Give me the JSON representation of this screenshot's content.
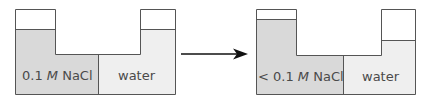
{
  "colors": {
    "salt_solution": "#d9d9d9",
    "water": "#efefef",
    "outline": "#555555",
    "arrow": "#111111",
    "background": "#ffffff"
  },
  "before": {
    "left_label_prefix": "0.1 ",
    "left_label_unit": "M",
    "left_label_suffix": " NaCl",
    "right_label": "water"
  },
  "after": {
    "left_label_prefix": "< 0.1 ",
    "left_label_unit": "M",
    "left_label_suffix": " NaCl",
    "right_label": "water"
  },
  "arrow": {
    "direction": "right"
  }
}
